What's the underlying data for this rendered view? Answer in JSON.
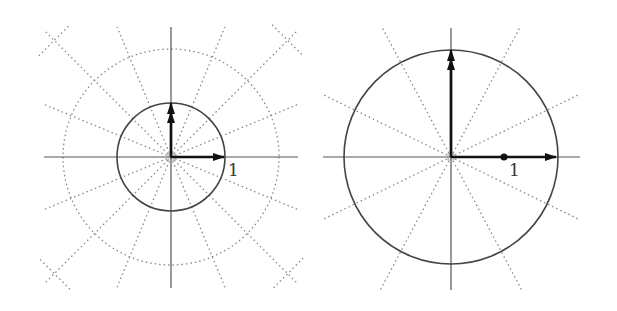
{
  "panels": [
    {
      "id": "left",
      "origin": [
        171,
        157
      ],
      "axis_extent": {
        "x": [
          44,
          298
        ],
        "y": [
          27,
          288
        ]
      },
      "unit_circle_radius_px": 54,
      "dotted_circle_radius_px": 108,
      "ray_angles_deg": [
        22.5,
        45,
        67.5,
        112.5,
        135,
        157.5,
        202.5,
        225,
        247.5,
        292.5,
        315,
        337.5
      ],
      "ray_length_px": 180,
      "x_arrow_tip": [
        224,
        157
      ],
      "y_arrow_tip": [
        171,
        103
      ],
      "unit_label": "1",
      "unit_label_pos": [
        228,
        160
      ],
      "colors": {
        "axis": "#555555",
        "circle": "#444444",
        "dotted": "#888888",
        "arrow": "#111111"
      }
    },
    {
      "id": "right",
      "origin": [
        451,
        157
      ],
      "axis_extent": {
        "x": [
          323,
          580
        ],
        "y": [
          28,
          290
        ]
      },
      "unit_circle_radius_px": 107,
      "ray_angles_deg": [
        26,
        62,
        118,
        154,
        206,
        242,
        298,
        334
      ],
      "ray_length_px": 150,
      "x_arrow_tip": [
        556,
        157
      ],
      "y_arrow_tip": [
        451,
        50
      ],
      "unit_dot": [
        504,
        157
      ],
      "unit_label": "1",
      "unit_label_pos": [
        509,
        160
      ],
      "colors": {
        "axis": "#555555",
        "circle": "#444444",
        "dotted": "#888888",
        "arrow": "#111111"
      }
    }
  ]
}
